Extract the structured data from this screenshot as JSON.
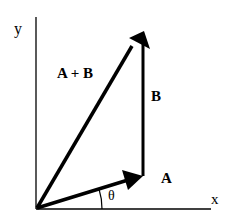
{
  "diagram": {
    "axes": {
      "x_label": "x",
      "y_label": "y"
    },
    "vectors": [
      {
        "name": "A",
        "label": "A",
        "from": [
          37,
          208
        ],
        "to": [
          143,
          175
        ]
      },
      {
        "name": "B",
        "label": "B",
        "from": [
          143,
          175
        ],
        "to": [
          143,
          30
        ]
      },
      {
        "name": "A+B",
        "label": "A + B",
        "from": [
          37,
          208
        ],
        "to": [
          143,
          30
        ]
      }
    ],
    "angle_label": "θ",
    "colors": {
      "stroke": "#000000",
      "background": "#ffffff"
    }
  }
}
